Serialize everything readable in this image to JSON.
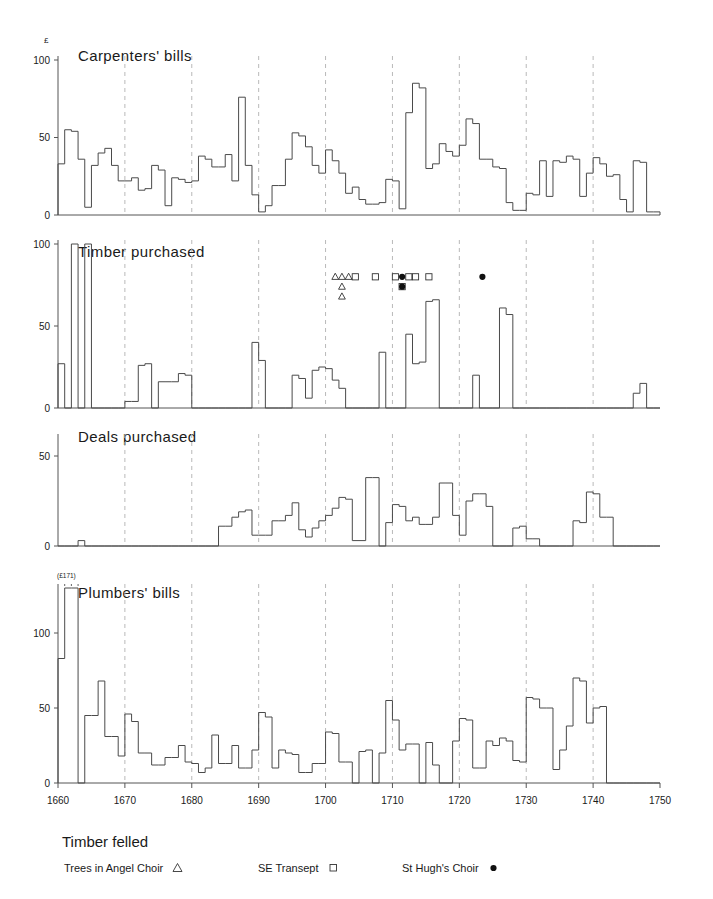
{
  "figure": {
    "unit_symbol": "£",
    "axis_color": "#555555",
    "bar_color": "#4a4a4a",
    "grid_color": "#b9b9b9",
    "x_min": 1660,
    "x_max": 1750,
    "x_ticks": [
      1660,
      1670,
      1680,
      1690,
      1700,
      1710,
      1720,
      1730,
      1740,
      1750
    ],
    "x_tick_labels": [
      "1660",
      "1670",
      "1680",
      "1690",
      "1700",
      "1710",
      "1720",
      "1730",
      "1740",
      "1750"
    ],
    "gridlines": [
      1670,
      1680,
      1690,
      1700,
      1710,
      1720,
      1730,
      1740
    ]
  },
  "legend": {
    "title": "Timber felled",
    "entries": [
      {
        "label": "Trees in Angel Choir",
        "marker": "triangle-open-marker"
      },
      {
        "label": "SE Transept",
        "marker": "square-open-marker"
      },
      {
        "label": "St Hugh's Choir",
        "marker": "circle-filled-marker"
      }
    ]
  },
  "annotations": [
    {
      "text": "(£171)",
      "panel": 3,
      "year": 1662
    }
  ],
  "chart_data": [
    {
      "type": "bar",
      "title": "Carpenters' bills",
      "xlabel": "",
      "ylabel": "£",
      "ylim": [
        0,
        100
      ],
      "y_ticks": [
        0,
        50,
        100
      ],
      "y_tick_labels": [
        "0",
        "50",
        "100"
      ],
      "x": [
        1660,
        1661,
        1662,
        1663,
        1664,
        1665,
        1666,
        1667,
        1668,
        1669,
        1670,
        1671,
        1672,
        1673,
        1674,
        1675,
        1676,
        1677,
        1678,
        1679,
        1680,
        1681,
        1682,
        1683,
        1684,
        1685,
        1686,
        1687,
        1688,
        1689,
        1690,
        1691,
        1692,
        1693,
        1694,
        1695,
        1696,
        1697,
        1698,
        1699,
        1700,
        1701,
        1702,
        1703,
        1704,
        1705,
        1706,
        1707,
        1708,
        1709,
        1710,
        1711,
        1712,
        1713,
        1714,
        1715,
        1716,
        1717,
        1718,
        1719,
        1720,
        1721,
        1722,
        1723,
        1724,
        1725,
        1726,
        1727,
        1728,
        1729,
        1730,
        1731,
        1732,
        1733,
        1734,
        1735,
        1736,
        1737,
        1738,
        1739,
        1740,
        1741,
        1742,
        1743,
        1744,
        1745,
        1746,
        1747,
        1748,
        1749
      ],
      "values": [
        33,
        55,
        54,
        36,
        5,
        32,
        40,
        43,
        32,
        22,
        22,
        24,
        16,
        17,
        32,
        29,
        6,
        24,
        23,
        21,
        22,
        38,
        36,
        31,
        31,
        39,
        22,
        76,
        32,
        13,
        2,
        6,
        19,
        19,
        36,
        53,
        51,
        44,
        32,
        27,
        42,
        35,
        27,
        14,
        18,
        10,
        7,
        7,
        8,
        23,
        22,
        4,
        66,
        85,
        82,
        30,
        33,
        46,
        41,
        38,
        45,
        62,
        59,
        36,
        36,
        31,
        30,
        8,
        3,
        3,
        14,
        13,
        35,
        12,
        35,
        34,
        38,
        36,
        12,
        27,
        37,
        33,
        25,
        26,
        10,
        2,
        35,
        34,
        2,
        2
      ]
    },
    {
      "type": "bar",
      "title": "Timber purchased",
      "xlabel": "",
      "ylabel": "£",
      "ylim": [
        0,
        100
      ],
      "y_ticks": [
        0,
        50,
        100
      ],
      "y_tick_labels": [
        "0",
        "50",
        "100"
      ],
      "x": [
        1660,
        1661,
        1662,
        1663,
        1664,
        1665,
        1666,
        1667,
        1668,
        1669,
        1670,
        1671,
        1672,
        1673,
        1674,
        1675,
        1676,
        1677,
        1678,
        1679,
        1680,
        1681,
        1682,
        1683,
        1684,
        1685,
        1686,
        1687,
        1688,
        1689,
        1690,
        1691,
        1692,
        1693,
        1694,
        1695,
        1696,
        1697,
        1698,
        1699,
        1700,
        1701,
        1702,
        1703,
        1704,
        1705,
        1706,
        1707,
        1708,
        1709,
        1710,
        1711,
        1712,
        1713,
        1714,
        1715,
        1716,
        1717,
        1718,
        1719,
        1720,
        1721,
        1722,
        1723,
        1724,
        1725,
        1726,
        1727,
        1728,
        1729,
        1730,
        1731,
        1732,
        1733,
        1734,
        1735,
        1736,
        1737,
        1738,
        1739,
        1740,
        1741,
        1742,
        1743,
        1744,
        1745,
        1746,
        1747,
        1748,
        1749
      ],
      "values": [
        27,
        0,
        103,
        0,
        101,
        0,
        0,
        0,
        0,
        0,
        4,
        4,
        26,
        27,
        0,
        16,
        16,
        16,
        21,
        20,
        0,
        0,
        0,
        0,
        0,
        0,
        0,
        0,
        0,
        40,
        29,
        0,
        0,
        0,
        0,
        20,
        18,
        6,
        23,
        25,
        24,
        17,
        12,
        0,
        0,
        0,
        0,
        0,
        34,
        0,
        0,
        0,
        45,
        27,
        28,
        65,
        66,
        0,
        0,
        0,
        0,
        0,
        20,
        0,
        0,
        0,
        61,
        57,
        0,
        0,
        0,
        0,
        0,
        0,
        0,
        0,
        0,
        0,
        0,
        0,
        0,
        0,
        0,
        0,
        0,
        0,
        9,
        15,
        0,
        0
      ]
    },
    {
      "type": "bar",
      "title": "Deals purchased",
      "xlabel": "",
      "ylabel": "£",
      "ylim": [
        0,
        60
      ],
      "y_ticks": [
        0,
        50
      ],
      "y_tick_labels": [
        "0",
        "50"
      ],
      "x": [
        1660,
        1661,
        1662,
        1663,
        1664,
        1665,
        1666,
        1667,
        1668,
        1669,
        1670,
        1671,
        1672,
        1673,
        1674,
        1675,
        1676,
        1677,
        1678,
        1679,
        1680,
        1681,
        1682,
        1683,
        1684,
        1685,
        1686,
        1687,
        1688,
        1689,
        1690,
        1691,
        1692,
        1693,
        1694,
        1695,
        1696,
        1697,
        1698,
        1699,
        1700,
        1701,
        1702,
        1703,
        1704,
        1705,
        1706,
        1707,
        1708,
        1709,
        1710,
        1711,
        1712,
        1713,
        1714,
        1715,
        1716,
        1717,
        1718,
        1719,
        1720,
        1721,
        1722,
        1723,
        1724,
        1725,
        1726,
        1727,
        1728,
        1729,
        1730,
        1731,
        1732,
        1733,
        1734,
        1735,
        1736,
        1737,
        1738,
        1739,
        1740,
        1741,
        1742,
        1743,
        1744,
        1745,
        1746,
        1747,
        1748,
        1749
      ],
      "values": [
        0,
        0,
        0,
        3,
        0,
        0,
        0,
        0,
        0,
        0,
        0,
        0,
        0,
        0,
        0,
        0,
        0,
        0,
        0,
        0,
        0,
        0,
        0,
        0,
        11,
        11,
        16,
        19,
        20,
        6,
        6,
        6,
        14,
        14,
        17,
        24,
        9,
        5,
        10,
        14,
        17,
        21,
        27,
        26,
        3,
        3,
        38,
        38,
        0,
        13,
        23,
        22,
        14,
        16,
        12,
        12,
        16,
        35,
        35,
        17,
        6,
        25,
        29,
        29,
        22,
        0,
        0,
        0,
        10,
        11,
        4,
        4,
        0,
        0,
        0,
        0,
        0,
        14,
        13,
        30,
        29,
        16,
        16,
        0,
        0,
        0,
        0,
        0,
        0,
        0
      ]
    },
    {
      "type": "bar",
      "title": "Plumbers' bills",
      "xlabel": "",
      "ylabel": "£",
      "ylim": [
        0,
        130
      ],
      "y_ticks": [
        0,
        50,
        100
      ],
      "y_tick_labels": [
        "0",
        "50",
        "100"
      ],
      "x": [
        1660,
        1661,
        1662,
        1663,
        1664,
        1665,
        1666,
        1667,
        1668,
        1669,
        1670,
        1671,
        1672,
        1673,
        1674,
        1675,
        1676,
        1677,
        1678,
        1679,
        1680,
        1681,
        1682,
        1683,
        1684,
        1685,
        1686,
        1687,
        1688,
        1689,
        1690,
        1691,
        1692,
        1693,
        1694,
        1695,
        1696,
        1697,
        1698,
        1699,
        1700,
        1701,
        1702,
        1703,
        1704,
        1705,
        1706,
        1707,
        1708,
        1709,
        1710,
        1711,
        1712,
        1713,
        1714,
        1715,
        1716,
        1717,
        1718,
        1719,
        1720,
        1721,
        1722,
        1723,
        1724,
        1725,
        1726,
        1727,
        1728,
        1729,
        1730,
        1731,
        1732,
        1733,
        1734,
        1735,
        1736,
        1737,
        1738,
        1739,
        1740,
        1741,
        1742,
        1743,
        1744,
        1745,
        1746,
        1747,
        1748,
        1749
      ],
      "values": [
        83,
        130,
        130,
        0,
        45,
        45,
        68,
        31,
        31,
        18,
        46,
        41,
        20,
        20,
        12,
        12,
        17,
        17,
        25,
        14,
        13,
        7,
        10,
        32,
        13,
        13,
        25,
        10,
        10,
        22,
        47,
        44,
        10,
        22,
        20,
        19,
        7,
        7,
        13,
        13,
        34,
        33,
        14,
        14,
        0,
        21,
        22,
        0,
        20,
        55,
        42,
        22,
        26,
        26,
        0,
        27,
        12,
        0,
        0,
        28,
        43,
        42,
        10,
        10,
        28,
        25,
        30,
        28,
        15,
        14,
        57,
        56,
        50,
        50,
        9,
        22,
        38,
        70,
        68,
        40,
        50,
        51,
        0,
        0,
        0,
        0,
        0,
        0,
        0,
        0
      ]
    }
  ],
  "felling_markers": {
    "angel_choir_years": [
      1701,
      1702,
      1703,
      1702,
      1702
    ],
    "se_transept_years": [
      1704,
      1707,
      1710,
      1712,
      1713,
      1711,
      1715
    ],
    "st_hughs_years": [
      1711,
      1711,
      1723
    ]
  }
}
